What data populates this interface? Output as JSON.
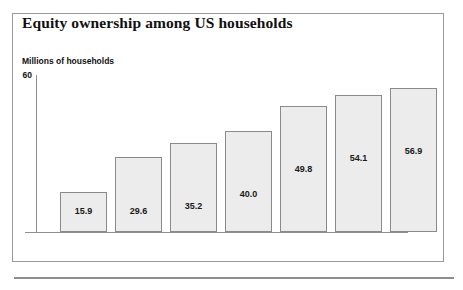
{
  "figure": {
    "title": "Equity ownership among US households",
    "axis_label": "Millions of households"
  },
  "chart_data": {
    "type": "bar",
    "title": "Equity ownership among US households",
    "subtitle": "",
    "xlabel": "",
    "ylabel": "Millions of households",
    "categories": [
      "1983",
      "1989",
      "1992",
      "1995",
      "1999",
      "2002",
      "2005"
    ],
    "values": [
      15.9,
      29.6,
      35.2,
      40.0,
      49.8,
      54.1,
      56.9
    ],
    "value_labels": [
      "15.9",
      "29.6",
      "35.2",
      "40.0",
      "49.8",
      "54.1",
      "56.9"
    ],
    "ytick_labels": [
      "60"
    ],
    "yticks": [
      60
    ],
    "ylim": [
      0,
      62
    ],
    "grid": false,
    "legend": false,
    "legend_position": "none",
    "bar_fill_color": "#ececec",
    "bar_border_color": "#8a8a8a",
    "axis_color": "#8f8f8f",
    "text_color": "#111111"
  }
}
